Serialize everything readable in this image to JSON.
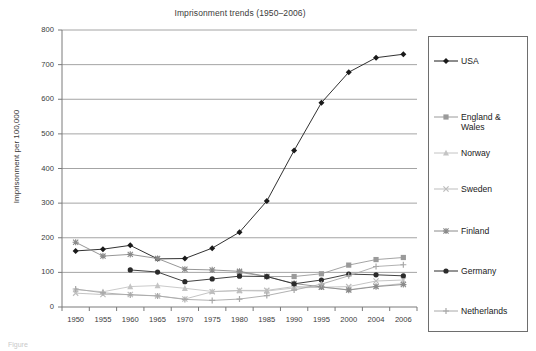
{
  "figure": {
    "title": "Imprisonment trends (1950–2006)",
    "ylabel": "Imprisonment per 100,000",
    "xlabel": "",
    "caption_fragment": "Figure"
  },
  "axes": {
    "y_ticks": [
      "800",
      "700",
      "600",
      "500",
      "400",
      "300",
      "200",
      "100",
      "0"
    ],
    "x_ticks": [
      "1950",
      "1955",
      "1960",
      "1965",
      "1970",
      "1975",
      "1980",
      "1985",
      "1990",
      "1995",
      "2000",
      "2004",
      "2006"
    ]
  },
  "legend": {
    "position": "right",
    "items": [
      {
        "label": "USA",
        "marker": "diamond-marker",
        "color": "#1a1a1a"
      },
      {
        "label": "England &\nWales",
        "marker": "square-marker",
        "color": "#9a9a9a"
      },
      {
        "label": "Norway",
        "marker": "triangle-marker",
        "color": "#c4c4c4"
      },
      {
        "label": "Sweden",
        "marker": "cross-x-marker",
        "color": "#bdbdbd"
      },
      {
        "label": "Finland",
        "marker": "asterisk-marker",
        "color": "#8a8a8a"
      },
      {
        "label": "Germany",
        "marker": "circle-marker",
        "color": "#2b2b2b"
      },
      {
        "label": "Netherlands",
        "marker": "plus-marker",
        "color": "#a8a8a8"
      }
    ]
  },
  "chart_data": {
    "type": "line",
    "title": "Imprisonment trends (1950–2006)",
    "xlabel": "",
    "ylabel": "Imprisonment per 100,000",
    "categories": [
      "1950",
      "1955",
      "1960",
      "1965",
      "1970",
      "1975",
      "1980",
      "1985",
      "1990",
      "1995",
      "2000",
      "2004",
      "2006"
    ],
    "ylim": [
      0,
      800
    ],
    "ytick_step": 100,
    "grid": "horizontal",
    "legend_position": "right",
    "series": [
      {
        "name": "USA",
        "marker": "diamond-marker",
        "color": "#1a1a1a",
        "values": [
          162,
          167,
          178,
          139,
          140,
          170,
          216,
          306,
          452,
          590,
          678,
          720,
          730
        ]
      },
      {
        "name": "England & Wales",
        "marker": "square-marker",
        "color": "#9a9a9a",
        "values": [
          null,
          null,
          null,
          null,
          null,
          null,
          100,
          88,
          88,
          96,
          121,
          137,
          143
        ]
      },
      {
        "name": "Norway",
        "marker": "triangle-marker",
        "color": "#c4c4c4",
        "values": [
          50,
          44,
          59,
          62,
          54,
          45,
          47,
          46,
          55,
          57,
          50,
          60,
          68
        ]
      },
      {
        "name": "Sweden",
        "marker": "cross-x-marker",
        "color": "#bdbdbd",
        "values": [
          40,
          36,
          36,
          32,
          23,
          44,
          48,
          48,
          59,
          57,
          59,
          75,
          78
        ]
      },
      {
        "name": "Finland",
        "marker": "asterisk-marker",
        "color": "#8a8a8a",
        "values": [
          187,
          147,
          152,
          140,
          109,
          107,
          103,
          88,
          68,
          58,
          49,
          59,
          65
        ]
      },
      {
        "name": "Germany",
        "marker": "circle-marker",
        "color": "#2b2b2b",
        "values": [
          null,
          null,
          107,
          101,
          73,
          81,
          89,
          88,
          67,
          78,
          95,
          93,
          90
        ]
      },
      {
        "name": "Netherlands",
        "marker": "plus-marker",
        "color": "#a8a8a8",
        "values": [
          52,
          41,
          35,
          32,
          22,
          19,
          23,
          33,
          49,
          66,
          90,
          117,
          122
        ]
      }
    ]
  }
}
